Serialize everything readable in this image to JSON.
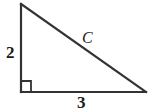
{
  "figure": {
    "type": "right-triangle-diagram",
    "background_color": "#ffffff",
    "stroke_color": "#333333",
    "canvas": {
      "width": 155,
      "height": 110
    }
  },
  "triangle": {
    "vertices": {
      "top": {
        "x": 21,
        "y": 4
      },
      "bottom_left": {
        "x": 21,
        "y": 92
      },
      "bottom_right": {
        "x": 146,
        "y": 92
      }
    },
    "right_angle_marker": {
      "at": "bottom_left",
      "size": 10
    }
  },
  "labels": {
    "vertical_leg": "2",
    "horizontal_leg": "3",
    "hypotenuse": "C"
  }
}
